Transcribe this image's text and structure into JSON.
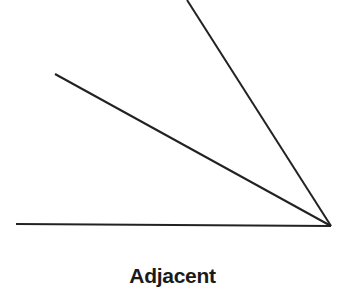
{
  "diagram": {
    "label": "Adjacent",
    "line_color": "#222222",
    "vertex": {
      "x": 331,
      "y": 226
    },
    "lines": [
      {
        "name": "adjacent-side",
        "x1": 16,
        "y1": 224,
        "x2": 331,
        "y2": 226
      },
      {
        "name": "middle-ray",
        "x1": 55,
        "y1": 74,
        "x2": 331,
        "y2": 226
      },
      {
        "name": "steep-ray",
        "x1": 187,
        "y1": 0,
        "x2": 331,
        "y2": 226
      }
    ]
  }
}
